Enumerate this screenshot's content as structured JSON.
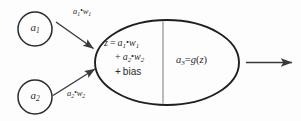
{
  "diagram": {
    "background_color": "#fdfdfd",
    "stroke_color": "#2b2b2b",
    "divider_color": "#7a7a7a",
    "input_nodes": [
      {
        "id": "a1",
        "label": "a",
        "subscript": "1"
      },
      {
        "id": "a2",
        "label": "a",
        "subscript": "2"
      }
    ],
    "edges": [
      {
        "id": "edge-top",
        "label_a": "a",
        "label_a_sub": "1",
        "op": "•",
        "label_w": "w",
        "label_w_sub": "1"
      },
      {
        "id": "edge-bot",
        "label_a": "a",
        "label_a_sub": "2",
        "op": "•",
        "label_w": "w",
        "label_w_sub": "2"
      }
    ],
    "body": {
      "left_half": {
        "line1_lhs": "z",
        "line1_eq": "=",
        "line1_a": "a",
        "line1_a_sub": "1",
        "line1_op": "•",
        "line1_w": "w",
        "line1_w_sub": "1",
        "line2_plus": "+",
        "line2_a": "a",
        "line2_a_sub": "2",
        "line2_op": "•",
        "line2_w": "w",
        "line2_w_sub": "2",
        "line3_plus": "+",
        "line3_text": "bias"
      },
      "right_half": {
        "out_a": "a",
        "out_a_sub": "3",
        "eq": "=",
        "fn": "g",
        "open": "(",
        "arg": "z",
        "close": ")"
      }
    },
    "output_arrow": {
      "name": "output-arrow"
    }
  }
}
